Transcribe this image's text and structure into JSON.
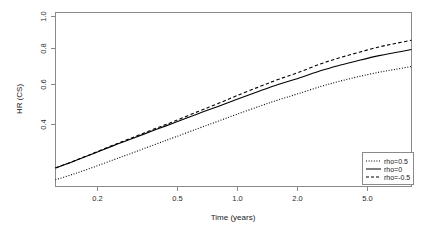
{
  "chart_data": {
    "type": "line",
    "title": "",
    "xlabel": "Time (years)",
    "ylabel": "HR (CS)",
    "xscale": "log",
    "xlim": [
      0.13,
      7.2
    ],
    "ylim": [
      0.17,
      1.03
    ],
    "grid": false,
    "legend_position": "bottom-right",
    "xticks": [
      0.2,
      0.5,
      1.0,
      2.0,
      5.0
    ],
    "xtick_labels": [
      "0.2",
      "0.5",
      "1.0",
      "2.0",
      "5.0"
    ],
    "yticks": [
      0.4,
      0.6,
      0.8,
      1.0
    ],
    "ytick_labels": [
      "0.4",
      "0.6",
      "0.8",
      "1.0"
    ],
    "x": [
      0.13,
      0.16,
      0.2,
      0.25,
      0.3,
      0.4,
      0.5,
      0.65,
      0.8,
      1.0,
      1.3,
      1.6,
      2.0,
      2.6,
      3.2,
      4.0,
      5.0,
      6.0,
      7.2
    ],
    "series": [
      {
        "name": "rho=0.5",
        "label": "rho=0.5",
        "dash": "dotted",
        "color": "#000000",
        "values": [
          0.203,
          0.232,
          0.266,
          0.302,
          0.331,
          0.378,
          0.414,
          0.457,
          0.49,
          0.526,
          0.567,
          0.598,
          0.628,
          0.665,
          0.69,
          0.714,
          0.735,
          0.749,
          0.763
        ]
      },
      {
        "name": "rho=0",
        "label": "rho=0",
        "dash": "solid",
        "color": "#000000",
        "values": [
          0.262,
          0.295,
          0.333,
          0.372,
          0.402,
          0.45,
          0.486,
          0.53,
          0.563,
          0.6,
          0.642,
          0.674,
          0.704,
          0.743,
          0.769,
          0.794,
          0.817,
          0.832,
          0.847
        ]
      },
      {
        "name": "rho=-0.5",
        "label": "rho=-0.5",
        "dash": "dashed",
        "color": "#000000",
        "values": [
          0.262,
          0.296,
          0.335,
          0.375,
          0.406,
          0.456,
          0.494,
          0.541,
          0.577,
          0.618,
          0.664,
          0.699,
          0.733,
          0.777,
          0.806,
          0.834,
          0.86,
          0.877,
          0.893
        ]
      }
    ]
  },
  "axes": {
    "x_title": "Time (years)",
    "y_title": "HR (CS)"
  },
  "legend": {
    "entries": [
      {
        "label": "rho=0.5",
        "style": "dotted"
      },
      {
        "label": "rho=0",
        "style": "solid"
      },
      {
        "label": "rho=-0.5",
        "style": "dashed"
      }
    ]
  }
}
